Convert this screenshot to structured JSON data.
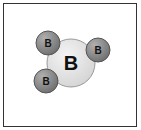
{
  "diagram": {
    "title": "",
    "central_atom": {
      "label": "B",
      "cx": 71,
      "cy": 63,
      "r": 24,
      "fill": "#e4e4e4",
      "stroke": "#9a9a9a"
    },
    "bonded_atoms": [
      {
        "label": "B",
        "cx": 48,
        "cy": 43,
        "r": 12,
        "fill": "#8a8a8a",
        "stroke": "#555555"
      },
      {
        "label": "B",
        "cx": 98,
        "cy": 50,
        "r": 12,
        "fill": "#8a8a8a",
        "stroke": "#555555"
      },
      {
        "label": "B",
        "cx": 46,
        "cy": 81,
        "r": 12,
        "fill": "#8a8a8a",
        "stroke": "#555555"
      }
    ]
  }
}
